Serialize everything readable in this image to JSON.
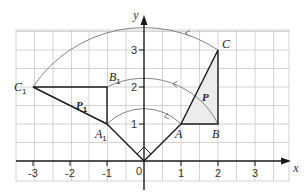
{
  "diagram": {
    "type": "rotation-on-coordinate-grid",
    "axes": {
      "x_label": "x",
      "y_label": "y",
      "x_ticks": [
        "-3",
        "-2",
        "-1",
        "0",
        "1",
        "2",
        "3"
      ],
      "y_ticks": [
        "1",
        "2",
        "3"
      ],
      "origin_label": "0"
    },
    "shapes": {
      "original": {
        "label": "P",
        "vertices": [
          {
            "name": "A",
            "coords": [
              1,
              1
            ]
          },
          {
            "name": "B",
            "coords": [
              2,
              1
            ]
          },
          {
            "name": "C",
            "coords": [
              2,
              3
            ]
          }
        ]
      },
      "image": {
        "label": "P",
        "label_sub": "1",
        "vertices": [
          {
            "name": "A",
            "sub": "1",
            "coords": [
              -1,
              1
            ]
          },
          {
            "name": "B",
            "sub": "1",
            "coords": [
              -1,
              2
            ]
          },
          {
            "name": "C",
            "sub": "1",
            "coords": [
              -3,
              2
            ]
          }
        ]
      }
    },
    "rotation": {
      "centre": [
        0,
        0
      ],
      "angle_deg": 90,
      "direction": "anticlockwise",
      "arcs": [
        {
          "from": "A",
          "to": "A1",
          "radius": "sqrt(2)"
        },
        {
          "from": "B",
          "to": "B1",
          "radius": "sqrt(5)"
        },
        {
          "from": "C",
          "to": "C1",
          "radius": "sqrt(13)"
        }
      ]
    },
    "colors": {
      "grid": "#c8c8c8",
      "lines": "#1a1a1a",
      "arcs": "#777777",
      "shade": "#ececec"
    }
  }
}
